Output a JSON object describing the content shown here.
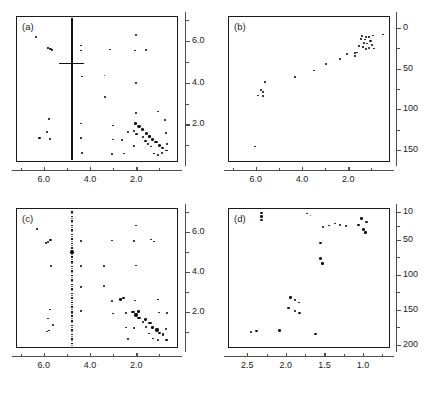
{
  "figure": {
    "title": "",
    "layout": "2x2 grid of 2D NMR contour/peak-pick spectra",
    "background": "#ffffff",
    "point_color": "#0d0d0d",
    "axis_color": "#4d4d4d",
    "frame_color": "#1a1a1a"
  },
  "chart_data": [
    {
      "type": "scatter",
      "panel": "a",
      "label": "(a)",
      "title": "",
      "xlabel": "",
      "ylabel": "",
      "xlim": [
        7.2,
        0.2
      ],
      "ylim": [
        7.2,
        0.2
      ],
      "x_ticks": [
        6.0,
        4.0,
        2.0
      ],
      "x_ticklabels": [
        "6.0",
        "4.0",
        "2.0"
      ],
      "x_minor_ticks": [
        7.0,
        5.0,
        3.0,
        1.0
      ],
      "y_ticks": [
        2.0,
        4.0,
        6.0
      ],
      "y_ticklabels": [
        "2.0",
        "4.0",
        "6.0"
      ],
      "y_minor_ticks": [
        1.0,
        3.0,
        5.0,
        7.0
      ],
      "y_axis_side": "right",
      "x_axis_reversed": true,
      "y_axis_reversed": true,
      "grid": false,
      "legend": null,
      "annotations": [
        "vertical t1-noise streak at 4.78 ppm (water)",
        "horizontal streak artifact near 5.0 ppm"
      ],
      "points": [
        [
          1.05,
          0.55,
          2.0
        ],
        [
          1.22,
          0.6,
          2.0
        ],
        [
          0.88,
          0.62,
          2.2
        ],
        [
          0.7,
          0.75,
          2.4
        ],
        [
          1.35,
          0.95,
          2.0
        ],
        [
          1.0,
          1.0,
          3.4
        ],
        [
          0.88,
          0.88,
          3.0
        ],
        [
          1.48,
          1.05,
          2.0
        ],
        [
          1.6,
          1.2,
          2.6
        ],
        [
          1.3,
          1.3,
          3.6
        ],
        [
          1.15,
          1.15,
          3.2
        ],
        [
          1.72,
          1.42,
          2.4
        ],
        [
          2.0,
          1.55,
          3.2
        ],
        [
          1.55,
          1.55,
          3.4
        ],
        [
          1.42,
          1.42,
          3.0
        ],
        [
          2.1,
          1.7,
          2.8
        ],
        [
          1.9,
          1.9,
          3.8
        ],
        [
          1.75,
          1.75,
          3.2
        ],
        [
          2.05,
          2.05,
          3.0
        ],
        [
          2.35,
          1.62,
          2.2
        ],
        [
          2.62,
          1.25,
          2.0
        ],
        [
          0.72,
          1.6,
          2.2
        ],
        [
          0.75,
          2.2,
          2.0
        ],
        [
          0.68,
          1.05,
          2.0
        ],
        [
          2.1,
          0.95,
          2.2
        ],
        [
          2.55,
          0.6,
          2.0
        ],
        [
          3.05,
          0.58,
          2.0
        ],
        [
          3.02,
          1.28,
          2.0
        ],
        [
          3.0,
          1.95,
          2.0
        ],
        [
          2.02,
          2.55,
          2.0
        ],
        [
          1.05,
          2.62,
          2.0
        ],
        [
          3.35,
          3.3,
          2.6
        ],
        [
          4.35,
          0.62,
          2.0
        ],
        [
          4.38,
          1.35,
          1.8
        ],
        [
          4.4,
          2.05,
          2.0
        ],
        [
          2.0,
          4.0,
          2.0
        ],
        [
          4.35,
          4.3,
          2.0
        ],
        [
          3.38,
          4.35,
          1.8
        ],
        [
          6.18,
          1.35,
          2.4
        ],
        [
          5.72,
          1.32,
          2.2
        ],
        [
          5.85,
          1.65,
          2.0
        ],
        [
          5.78,
          2.25,
          2.0
        ],
        [
          5.65,
          5.55,
          2.4
        ],
        [
          5.72,
          5.62,
          2.6
        ],
        [
          5.8,
          5.68,
          2.0
        ],
        [
          4.38,
          5.55,
          2.0
        ],
        [
          4.4,
          5.78,
          2.0
        ],
        [
          3.12,
          5.6,
          2.0
        ],
        [
          2.05,
          5.55,
          2.0
        ],
        [
          6.35,
          6.2,
          2.0
        ],
        [
          2.02,
          6.28,
          2.6
        ],
        [
          1.58,
          5.58,
          2.0
        ]
      ]
    },
    {
      "type": "scatter",
      "panel": "b",
      "label": "(b)",
      "title": "",
      "xlabel": "",
      "ylabel": "",
      "xlim": [
        7.2,
        0.2
      ],
      "ylim": [
        -15,
        165
      ],
      "x_ticks": [
        6.0,
        4.0,
        2.0
      ],
      "x_ticklabels": [
        "6.0",
        "4.0",
        "2.0"
      ],
      "x_minor_ticks": [
        7.0,
        5.0,
        3.0,
        1.0
      ],
      "y_ticks": [
        0,
        50,
        100,
        150
      ],
      "y_ticklabels": [
        "0",
        "50",
        "100",
        "150"
      ],
      "y_minor_ticks": [
        25,
        75,
        125
      ],
      "y_axis_side": "right",
      "x_axis_reversed": true,
      "y_axis_reversed": false,
      "grid": false,
      "legend": null,
      "annotations": [],
      "points": [
        [
          0.52,
          8.0,
          2.0
        ],
        [
          0.95,
          9.0,
          2.0
        ],
        [
          1.12,
          11.0,
          2.0
        ],
        [
          1.3,
          14.0,
          2.0
        ],
        [
          1.22,
          10.5,
          2.2
        ],
        [
          1.4,
          9.5,
          2.0
        ],
        [
          1.05,
          16.0,
          2.6
        ],
        [
          1.18,
          19.0,
          2.2
        ],
        [
          1.32,
          18.0,
          2.0
        ],
        [
          1.45,
          13.0,
          2.0
        ],
        [
          0.98,
          21.0,
          2.0
        ],
        [
          1.1,
          24.0,
          2.4
        ],
        [
          1.25,
          26.0,
          2.0
        ],
        [
          1.52,
          22.0,
          2.0
        ],
        [
          1.38,
          23.5,
          2.0
        ],
        [
          0.9,
          25.0,
          2.0
        ],
        [
          1.62,
          30.0,
          2.2
        ],
        [
          1.72,
          34.0,
          2.0
        ],
        [
          1.7,
          31.0,
          2.0
        ],
        [
          2.05,
          32.0,
          2.0
        ],
        [
          2.35,
          38.0,
          2.0
        ],
        [
          2.98,
          44.0,
          2.0
        ],
        [
          3.5,
          52.0,
          2.0
        ],
        [
          4.32,
          60.0,
          2.0
        ],
        [
          5.62,
          66.0,
          2.0
        ],
        [
          5.78,
          76.0,
          2.0
        ],
        [
          5.7,
          79.0,
          2.2
        ],
        [
          5.68,
          84.0,
          2.0
        ],
        [
          5.9,
          83.0,
          2.0
        ],
        [
          6.05,
          146.0,
          2.0
        ]
      ]
    },
    {
      "type": "scatter",
      "panel": "c",
      "label": "(c)",
      "title": "",
      "xlabel": "",
      "ylabel": "",
      "xlim": [
        7.2,
        0.2
      ],
      "ylim": [
        7.2,
        0.2
      ],
      "x_ticks": [
        6.0,
        4.0,
        2.0
      ],
      "x_ticklabels": [
        "6.0",
        "4.0",
        "2.0"
      ],
      "x_minor_ticks": [
        7.0,
        5.0,
        3.0,
        1.0
      ],
      "y_ticks": [
        2.0,
        4.0,
        6.0
      ],
      "y_ticklabels": [
        "2.0",
        "4.0",
        "6.0"
      ],
      "y_minor_ticks": [
        1.0,
        3.0,
        5.0,
        7.0
      ],
      "y_axis_side": "right",
      "x_axis_reversed": true,
      "y_axis_reversed": true,
      "grid": false,
      "legend": null,
      "annotations": [
        "faint dotted vertical t1-noise streak at 4.78 ppm"
      ],
      "points": [
        [
          1.05,
          0.58,
          2.2
        ],
        [
          0.7,
          0.62,
          2.4
        ],
        [
          1.28,
          0.68,
          2.0
        ],
        [
          1.0,
          0.95,
          2.6
        ],
        [
          0.85,
          0.88,
          2.8
        ],
        [
          1.45,
          0.92,
          2.0
        ],
        [
          1.1,
          1.1,
          3.8
        ],
        [
          1.3,
          1.22,
          3.0
        ],
        [
          0.72,
          1.15,
          2.2
        ],
        [
          1.58,
          1.25,
          2.2
        ],
        [
          1.42,
          1.45,
          3.6
        ],
        [
          1.72,
          1.52,
          2.6
        ],
        [
          1.88,
          1.7,
          3.4
        ],
        [
          1.6,
          1.62,
          3.2
        ],
        [
          2.0,
          1.85,
          3.8
        ],
        [
          2.15,
          2.0,
          3.4
        ],
        [
          1.9,
          2.02,
          3.0
        ],
        [
          2.45,
          1.95,
          2.0
        ],
        [
          0.68,
          1.95,
          2.0
        ],
        [
          1.02,
          1.98,
          2.0
        ],
        [
          2.1,
          1.18,
          2.4
        ],
        [
          2.45,
          1.22,
          2.0
        ],
        [
          2.38,
          0.65,
          2.0
        ],
        [
          3.02,
          1.92,
          2.2
        ],
        [
          3.05,
          2.55,
          2.0
        ],
        [
          2.68,
          2.62,
          2.8
        ],
        [
          2.55,
          2.72,
          2.6
        ],
        [
          3.38,
          3.28,
          2.2
        ],
        [
          1.05,
          2.62,
          2.0
        ],
        [
          2.05,
          2.58,
          2.0
        ],
        [
          4.38,
          2.05,
          2.0
        ],
        [
          4.4,
          3.25,
          2.0
        ],
        [
          4.4,
          4.3,
          2.0
        ],
        [
          3.4,
          4.3,
          2.0
        ],
        [
          2.02,
          4.32,
          2.0
        ],
        [
          5.85,
          1.02,
          2.2
        ],
        [
          5.78,
          1.08,
          2.0
        ],
        [
          5.6,
          1.35,
          2.2
        ],
        [
          5.8,
          1.68,
          2.0
        ],
        [
          5.72,
          2.12,
          2.0
        ],
        [
          5.68,
          4.3,
          2.0
        ],
        [
          5.82,
          5.52,
          2.4
        ],
        [
          5.7,
          5.6,
          2.6
        ],
        [
          5.9,
          5.45,
          2.0
        ],
        [
          4.4,
          5.55,
          2.0
        ],
        [
          3.05,
          5.58,
          2.0
        ],
        [
          2.12,
          5.55,
          2.0
        ],
        [
          1.22,
          5.52,
          2.0
        ],
        [
          6.28,
          6.15,
          2.0
        ],
        [
          2.02,
          6.32,
          2.2
        ],
        [
          1.38,
          5.62,
          2.0
        ]
      ]
    },
    {
      "type": "scatter",
      "panel": "d",
      "label": "(d)",
      "title": "",
      "xlabel": "",
      "ylabel": "",
      "xlim": [
        2.75,
        0.65
      ],
      "ylim": [
        5,
        205
      ],
      "x_ticks": [
        2.5,
        2.0,
        1.5,
        1.0
      ],
      "x_ticklabels": [
        "2.5",
        "2.0",
        "1.5",
        "1.0"
      ],
      "x_minor_ticks": [
        2.25,
        1.75,
        1.25,
        0.75
      ],
      "y_ticks": [
        10,
        50,
        100,
        150,
        200
      ],
      "y_ticklabels": [
        "10",
        "50",
        "100",
        "150",
        "200"
      ],
      "y_minor_ticks": [
        30,
        75,
        125,
        175
      ],
      "y_axis_side": "right",
      "x_axis_reversed": true,
      "y_axis_reversed": false,
      "grid": false,
      "legend": null,
      "annotations": [],
      "points": [
        [
          2.32,
          12.0,
          3.0
        ],
        [
          2.32,
          17.0,
          3.0
        ],
        [
          2.32,
          22.0,
          3.0
        ],
        [
          1.72,
          13.0,
          2.0
        ],
        [
          1.68,
          16.0,
          1.8
        ],
        [
          1.02,
          20.0,
          3.0
        ],
        [
          0.96,
          25.0,
          3.0
        ],
        [
          1.06,
          29.0,
          2.4
        ],
        [
          1.52,
          32.0,
          2.6
        ],
        [
          1.44,
          30.0,
          2.0
        ],
        [
          1.36,
          27.0,
          2.0
        ],
        [
          1.3,
          29.0,
          2.2
        ],
        [
          1.22,
          31.0,
          2.0
        ],
        [
          1.0,
          36.0,
          3.0
        ],
        [
          0.97,
          40.0,
          2.6
        ],
        [
          1.55,
          55.0,
          3.0
        ],
        [
          1.55,
          77.0,
          3.4
        ],
        [
          1.52,
          84.0,
          3.0
        ],
        [
          1.94,
          133.0,
          3.0
        ],
        [
          1.88,
          136.0,
          2.6
        ],
        [
          1.83,
          140.0,
          2.2
        ],
        [
          1.96,
          148.0,
          3.0
        ],
        [
          1.88,
          152.0,
          2.4
        ],
        [
          1.82,
          155.0,
          2.6
        ],
        [
          2.45,
          182.0,
          2.6
        ],
        [
          2.38,
          181.0,
          3.0
        ],
        [
          2.08,
          180.0,
          3.4
        ],
        [
          1.62,
          185.0,
          3.0
        ]
      ]
    }
  ]
}
